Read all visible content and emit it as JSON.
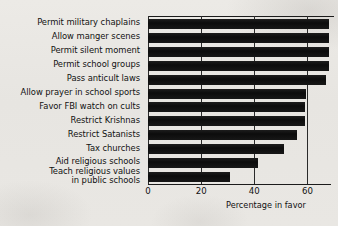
{
  "chart_data": {
    "type": "bar",
    "orientation": "horizontal",
    "title": "",
    "subtitle": "",
    "xlabel": "Percentage in favor",
    "ylabel": "",
    "xlim": [
      0,
      70
    ],
    "xticks": [
      0,
      20,
      40,
      60
    ],
    "xtick_labels": [
      "0",
      "20",
      "40",
      "60"
    ],
    "grid": "vertical",
    "legend": null,
    "bar_color": "#131313",
    "categories": [
      "Permit military chaplains",
      "Allow manger scenes",
      "Permit silent moment",
      "Permit school groups",
      "Pass anticult laws",
      "Allow prayer in school sports",
      "Favor FBI watch on cults",
      "Restrict Krishnas",
      "Restrict Satanists",
      "Tax churches",
      "Aid religious schools",
      "Teach religious values in public schools"
    ],
    "category_lines": [
      [
        "Permit military chaplains"
      ],
      [
        "Allow manger scenes"
      ],
      [
        "Permit silent moment"
      ],
      [
        "Permit school groups"
      ],
      [
        "Pass anticult laws"
      ],
      [
        "Allow prayer in school sports"
      ],
      [
        "Favor FBI watch on cults"
      ],
      [
        "Restrict Krishnas"
      ],
      [
        "Restrict Satanists"
      ],
      [
        "Tax churches"
      ],
      [
        "Aid religious schools"
      ],
      [
        "Teach religious values",
        "in public schools"
      ]
    ],
    "values": [
      68,
      68,
      68,
      68,
      67,
      59.5,
      59,
      59,
      56,
      51,
      41.5,
      31
    ]
  }
}
